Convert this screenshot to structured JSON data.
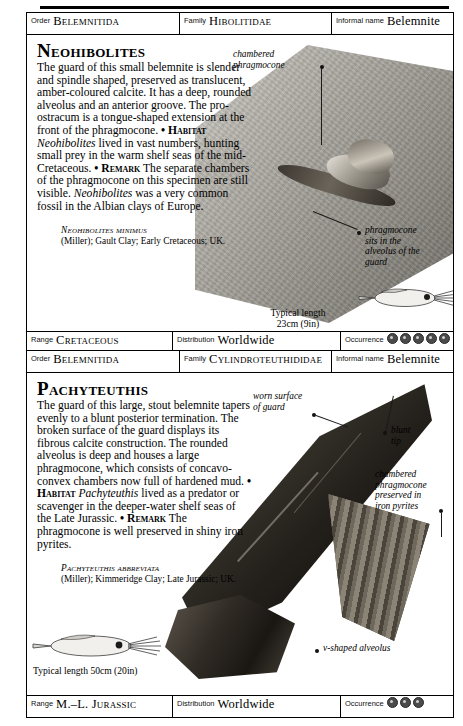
{
  "page": {
    "entries": [
      {
        "header": {
          "order_label": "Order",
          "order_value": "Belemnitida",
          "family_label": "Family",
          "family_value": "Hibolitidae",
          "informal_label": "Informal name",
          "informal_value": "Belemnite"
        },
        "genus": "Neohibolites",
        "description_html": "The guard of this small belemnite is slender and spindle shaped, preserved as translucent, amber-coloured calcite. It has a deep, rounded alveolus and an anterior groove. The pro-ostracum is a tongue-shaped extension at the front of the phragmocone.",
        "habitat_bullet": "• ",
        "habitat_label": "Habitat",
        "habitat_genus": "Neohibolites",
        "habitat_text": " lived in vast numbers, hunting small prey in the warm shelf seas of the mid-Cretaceous.",
        "remark_bullet": "• ",
        "remark_label": "Remark",
        "remark_text_1": " The separate chambers of the phragmocone on this specimen are still visible. ",
        "remark_genus": "Neohibolites",
        "remark_text_2": " was a very common fossil in the Albian clays of Europe.",
        "specimen_name": "Neohibolites minimus",
        "specimen_detail": "(Miller); Gault Clay; Early Cretaceous; UK.",
        "captions": [
          {
            "name": "chambered-phragmocone",
            "line1": "chambered",
            "line2": "phragmocone"
          },
          {
            "name": "phragmocone-alveolus",
            "line1": "phragmocone",
            "line2": "sits in the",
            "line3": "alveolus of the",
            "line4": "guard"
          }
        ],
        "typical_length_label": "Typical length",
        "typical_length_value": "23cm (9in)",
        "footer": {
          "range_label": "Range",
          "range_value": "Cretaceous",
          "distribution_label": "Distribution",
          "distribution_value": "Worldwide",
          "occurrence_label": "Occurrence",
          "occurrence_count": 6
        }
      },
      {
        "header": {
          "order_label": "Order",
          "order_value": "Belemnitida",
          "family_label": "Family",
          "family_value": "Cylindroteuthididae",
          "informal_label": "Informal name",
          "informal_value": "Belemnite"
        },
        "genus": "Pachyteuthis",
        "description_html": "The guard of this large, stout belemnite tapers evenly to a blunt posterior termination. The broken surface of the guard displays its fibrous calcite construction. The rounded alveolus is deep and houses a large phragmocone, which consists of concavo-convex chambers now full of hardened mud.",
        "habitat_bullet": "• ",
        "habitat_label": "Habitat",
        "habitat_genus": "Pachyteuthis",
        "habitat_text": " lived as a predator or scavenger in the deeper-water shelf seas of the Late Jurassic.",
        "remark_bullet": "• ",
        "remark_label": "Remark",
        "remark_text_1": " The phragmocone is well preserved in shiny iron pyrites.",
        "remark_genus": "",
        "remark_text_2": "",
        "specimen_name": "Pachyteuthis abbreviata",
        "specimen_detail": "(Miller); Kimmeridge Clay; Late Jurassic; UK.",
        "captions": [
          {
            "name": "worn-surface-of-guard",
            "line1": "worn surface",
            "line2": "of guard"
          },
          {
            "name": "blunt-tip",
            "line1": "blunt",
            "line2": "tip"
          },
          {
            "name": "chambered-phragmocone-pyrites",
            "line1": "chambered",
            "line2": "phragmocone",
            "line3": "preserved in",
            "line4": "iron pyrites"
          },
          {
            "name": "v-shaped-alveolus",
            "line1": "v-shaped alveolus"
          }
        ],
        "typical_length_label": "Typical length 50cm (20in)",
        "typical_length_value": "",
        "footer": {
          "range_label": "Range",
          "range_value": "M.–L. Jurassic",
          "distribution_label": "Distribution",
          "distribution_value": "Worldwide",
          "occurrence_label": "Occurrence",
          "occurrence_count": 3
        }
      }
    ]
  }
}
